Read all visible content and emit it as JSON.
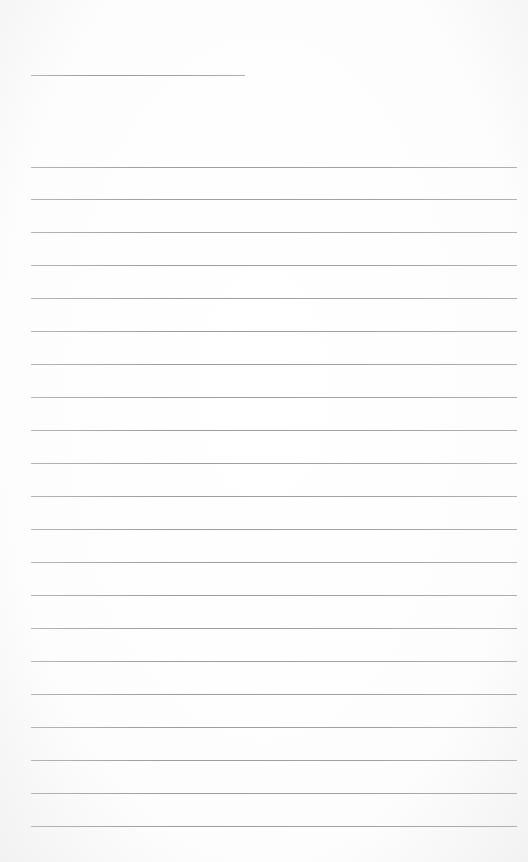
{
  "page": {
    "type": "blank lined paper",
    "background_color": "#fdfdfd",
    "line_color": "#9e9e9e",
    "header_line": {
      "count": 1,
      "length": "short",
      "label": ""
    },
    "ruled_lines": {
      "count": 21,
      "spacing_px": 33
    },
    "text_content": []
  }
}
